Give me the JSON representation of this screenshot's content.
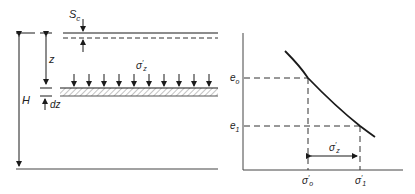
{
  "left_panel": {
    "settlement_label": "S",
    "settlement_sub": "c",
    "depth_label": "z",
    "thickness_label": "H",
    "increment_label": "dz",
    "stress_label": "σ",
    "stress_sup": "′",
    "stress_sub": "z"
  },
  "right_panel": {
    "y_ticks": [
      {
        "main": "e",
        "sub": "o"
      },
      {
        "main": "e",
        "sub": "1"
      }
    ],
    "x_ticks": [
      {
        "main": "σ",
        "sup": "′",
        "sub": "o"
      },
      {
        "main": "σ",
        "sup": "′",
        "sub": "1"
      }
    ],
    "delta_label": {
      "main": "σ",
      "sup": "′",
      "sub": "z"
    }
  },
  "colors": {
    "line": "#1a1a1a",
    "hatch": "#888888",
    "text": "#222222"
  }
}
